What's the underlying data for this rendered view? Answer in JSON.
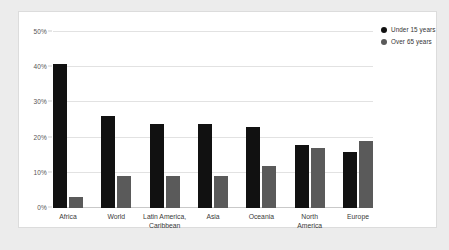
{
  "chart_data": {
    "type": "bar",
    "title": "",
    "xlabel": "",
    "ylabel": "",
    "ylim": [
      0,
      50
    ],
    "ytick_values": [
      0,
      10,
      20,
      30,
      40,
      50
    ],
    "ytick_labels": [
      "0%",
      "10%",
      "20%",
      "30%",
      "40%",
      "50%"
    ],
    "grid": true,
    "legend_position": "top-right",
    "categories": [
      "Africa",
      "World",
      "Latin America,\nCaribbean",
      "Asia",
      "Oceania",
      "North\nAmerica",
      "Europe"
    ],
    "series": [
      {
        "name": "Under 15 years",
        "color": "#111111",
        "values": [
          41,
          26,
          24,
          24,
          23,
          18,
          16
        ]
      },
      {
        "name": "Over 65 years",
        "color": "#5a5a5a",
        "values": [
          3,
          9,
          9,
          9,
          12,
          17,
          19
        ]
      }
    ]
  },
  "colors": {
    "page_background": "#ececec",
    "panel_background": "#ffffff",
    "panel_border": "#dcdcdc",
    "gridline": "#e2e2e2",
    "axis": "#c9c9c9",
    "under15": "#111111",
    "over65": "#5a5a5a",
    "tick_text": "#555555",
    "category_text": "#3a3a3a"
  }
}
